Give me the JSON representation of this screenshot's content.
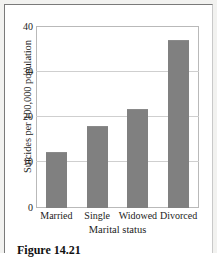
{
  "figure": {
    "caption": "Figure 14.21"
  },
  "chart_data": {
    "type": "bar",
    "title": "",
    "xlabel": "Marital status",
    "ylabel": "Suicides per 100,000 population",
    "categories": [
      "Married",
      "Single",
      "Widowed",
      "Divorced"
    ],
    "values": [
      12.4,
      18.2,
      21.8,
      37.1
    ],
    "yticks": [
      0,
      10,
      20,
      30,
      40
    ],
    "ytick_labels": [
      "0",
      "10",
      "20",
      "30",
      "40"
    ],
    "ylim": [
      0,
      40
    ],
    "grid": true,
    "legend": "none",
    "bar_color": "#808080",
    "plot_background": "#ffffff",
    "gridline_color": "#cfcfcf",
    "frame_color": "#b9b9b9"
  }
}
